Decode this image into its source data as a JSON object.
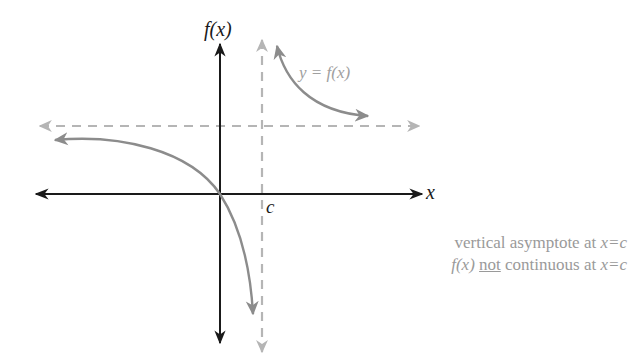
{
  "diagram": {
    "type": "function-graph",
    "axes": {
      "y_label": "f(x)",
      "x_label": "x"
    },
    "labels": {
      "curve": "y = f(x)",
      "asymptote_point": "c"
    },
    "caption": {
      "line1_prefix": "vertical asymptote at ",
      "line1_var": "x=c",
      "line2_fx": "f(x)",
      "line2_not": "not",
      "line2_mid": " continuous at ",
      "line2_var": "x=c"
    },
    "colors": {
      "axis": "#1a1a1a",
      "curve": "#8c8c8c",
      "asymptote": "#b5b5b5",
      "caption": "#9a9a9a"
    }
  }
}
